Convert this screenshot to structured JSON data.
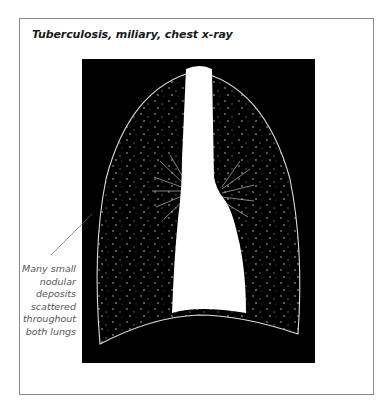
{
  "figure": {
    "title": "Tuberculosis, miliary, chest x-ray",
    "annotation": {
      "lines": [
        "Many small",
        "nodular",
        "deposits",
        "scattered",
        "throughout",
        "both lungs"
      ]
    }
  },
  "colors": {
    "frame_border": "#8a8a8a",
    "xray_background": "#000000",
    "lung_outline": "#dddddd",
    "mediastinum": "#ffffff",
    "annotation_text": "#555555",
    "leader_line": "#666666"
  }
}
